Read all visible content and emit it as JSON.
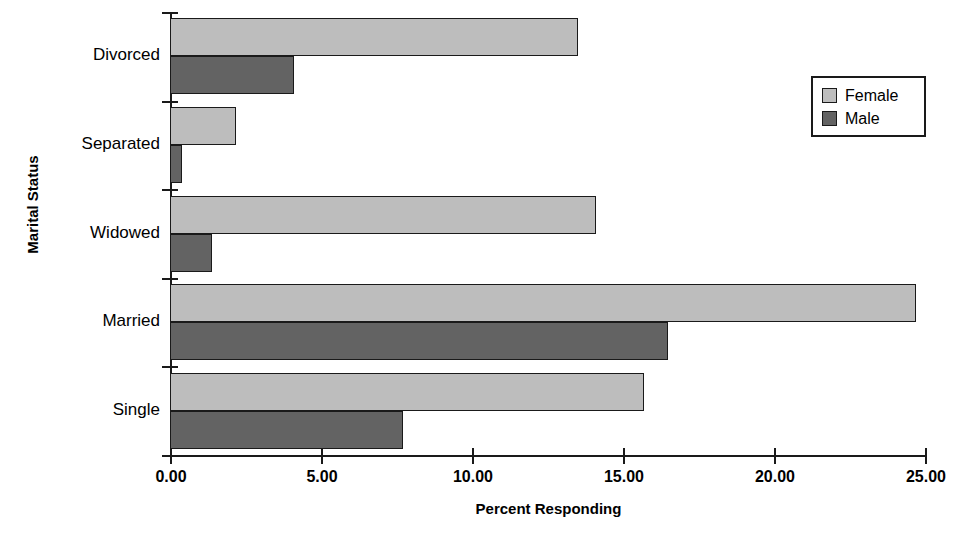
{
  "chart_data": {
    "type": "bar",
    "orientation": "horizontal",
    "title": "",
    "xlabel": "Percent Responding",
    "ylabel": "Marital Status",
    "categories": [
      "Divorced",
      "Separated",
      "Widowed",
      "Married",
      "Single"
    ],
    "series": [
      {
        "name": "Female",
        "color": "#bdbdbd",
        "values": [
          13.5,
          2.2,
          14.1,
          24.7,
          15.7
        ]
      },
      {
        "name": "Male",
        "color": "#636363",
        "values": [
          4.1,
          0.4,
          1.4,
          16.5,
          7.7
        ]
      }
    ],
    "xlim": [
      0,
      25
    ],
    "xticks": [
      0,
      5,
      10,
      15,
      20,
      25
    ],
    "xtick_labels": [
      "0.00",
      "5.00",
      "10.00",
      "15.00",
      "20.00",
      "25.00"
    ],
    "grid": false,
    "legend_position": "top-right",
    "legend_entries": [
      "Female",
      "Male"
    ]
  }
}
